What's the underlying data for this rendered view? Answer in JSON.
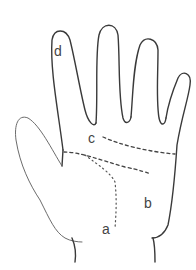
{
  "diagram": {
    "labels": {
      "a": "a",
      "b": "b",
      "c": "c",
      "d": "d"
    },
    "colors": {
      "stroke": "#3a3a3a",
      "background": "#ffffff"
    }
  }
}
